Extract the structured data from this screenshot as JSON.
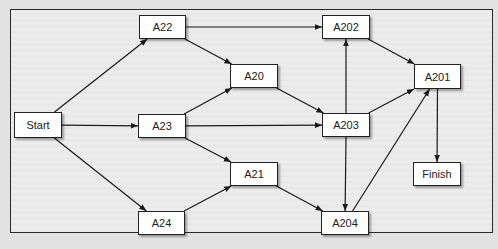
{
  "diagram": {
    "type": "activity-network",
    "nodes": [
      {
        "id": "start",
        "label": "Start",
        "x": 14,
        "y": 112,
        "w": 48,
        "h": 26
      },
      {
        "id": "a22",
        "label": "A22",
        "x": 139,
        "y": 15,
        "w": 47,
        "h": 24
      },
      {
        "id": "a23",
        "label": "A23",
        "x": 138,
        "y": 114,
        "w": 48,
        "h": 24
      },
      {
        "id": "a24",
        "label": "A24",
        "x": 138,
        "y": 211,
        "w": 47,
        "h": 24
      },
      {
        "id": "a20",
        "label": "A20",
        "x": 230,
        "y": 64,
        "w": 48,
        "h": 24
      },
      {
        "id": "a21",
        "label": "A21",
        "x": 230,
        "y": 162,
        "w": 48,
        "h": 24
      },
      {
        "id": "a202",
        "label": "A202",
        "x": 322,
        "y": 15,
        "w": 48,
        "h": 24
      },
      {
        "id": "a203",
        "label": "A203",
        "x": 322,
        "y": 113,
        "w": 48,
        "h": 24
      },
      {
        "id": "a204",
        "label": "A204",
        "x": 321,
        "y": 211,
        "w": 48,
        "h": 24
      },
      {
        "id": "a201",
        "label": "A201",
        "x": 414,
        "y": 64,
        "w": 47,
        "h": 25
      },
      {
        "id": "finish",
        "label": "Finish",
        "x": 413,
        "y": 162,
        "w": 48,
        "h": 24
      }
    ],
    "edges": [
      {
        "from": "start",
        "to": "a22"
      },
      {
        "from": "start",
        "to": "a23"
      },
      {
        "from": "start",
        "to": "a24"
      },
      {
        "from": "a22",
        "to": "a202"
      },
      {
        "from": "a22",
        "to": "a20"
      },
      {
        "from": "a23",
        "to": "a20"
      },
      {
        "from": "a23",
        "to": "a203"
      },
      {
        "from": "a23",
        "to": "a21"
      },
      {
        "from": "a24",
        "to": "a21"
      },
      {
        "from": "a20",
        "to": "a203"
      },
      {
        "from": "a21",
        "to": "a204"
      },
      {
        "from": "a203",
        "to": "a202"
      },
      {
        "from": "a203",
        "to": "a204"
      },
      {
        "from": "a203",
        "to": "a201"
      },
      {
        "from": "a202",
        "to": "a201"
      },
      {
        "from": "a204",
        "to": "a201"
      },
      {
        "from": "a201",
        "to": "finish"
      }
    ]
  }
}
